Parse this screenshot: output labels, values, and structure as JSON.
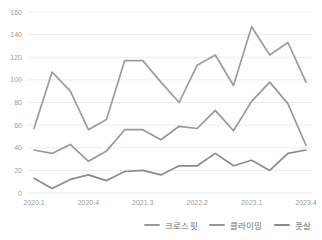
{
  "chart_data": {
    "type": "line",
    "title": "",
    "xlabel": "",
    "ylabel": "",
    "ylim": [
      0,
      160
    ],
    "y_tick_step": 20,
    "y_tick_labels": [
      "0",
      "20",
      "40",
      "60",
      "80",
      "100",
      "120",
      "140",
      "160"
    ],
    "grid": true,
    "legend_position": "bottom-right",
    "categories": [
      "2020.1",
      "2020.2",
      "2020.3",
      "2020.4",
      "2021.1",
      "2021.2",
      "2021.3",
      "2021.4",
      "2022.1",
      "2022.2",
      "2022.3",
      "2022.4",
      "2023.1",
      "2023.2",
      "2023.3",
      "2023.4"
    ],
    "x_tick_labels": [
      "2020.1",
      "2020.4",
      "2021.3",
      "2022.2",
      "2023.1",
      "2023.4"
    ],
    "x_tick_indices": [
      0,
      3,
      6,
      9,
      12,
      15
    ],
    "series": [
      {
        "name": "크로스핏",
        "color": "#9c9c9c",
        "values": [
          57,
          107,
          90,
          56,
          65,
          117,
          117,
          98,
          80,
          113,
          122,
          95,
          147,
          122,
          133,
          98
        ]
      },
      {
        "name": "클라이밍",
        "color": "#989898",
        "values": [
          38,
          35,
          43,
          28,
          37,
          56,
          56,
          47,
          59,
          57,
          73,
          55,
          81,
          98,
          79,
          42
        ]
      },
      {
        "name": "풋살",
        "color": "#8b8b8b",
        "values": [
          13,
          4,
          12,
          16,
          11,
          19,
          20,
          16,
          24,
          24,
          35,
          24,
          29,
          20,
          35,
          38
        ]
      }
    ]
  },
  "layout_colors": {
    "background": "#ffffff",
    "gridline": "#ececec",
    "tick_text": "#9b9b9b",
    "legend_text": "#6e6e6e"
  }
}
